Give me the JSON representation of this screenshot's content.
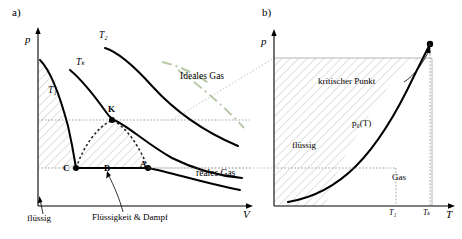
{
  "figure": {
    "panel_a": {
      "letter": "a)",
      "y_axis": "p",
      "x_axis": "V",
      "isotherm_labels": [
        "T₁",
        "Tₖ",
        "T₂"
      ],
      "curve_labels": [
        "Ideales Gas",
        "reales Gas"
      ],
      "points": [
        "K",
        "C",
        "B",
        "A"
      ],
      "region_labels": [
        "flüssig",
        "Flüssigkeit & Dampf"
      ]
    },
    "panel_b": {
      "letter": "b)",
      "y_axis": "p",
      "x_axis": "T",
      "annotations": [
        "kritischer Punkt",
        "p₀(T)"
      ],
      "region_labels": [
        "flüssig",
        "Gas"
      ],
      "tick_labels": [
        "T₁",
        "Tₖ"
      ]
    }
  },
  "colors": {
    "line": "#000000",
    "ideal_gas": "#b9c9a8",
    "hatch": "#9a9a9a",
    "dotted": "#333333"
  }
}
